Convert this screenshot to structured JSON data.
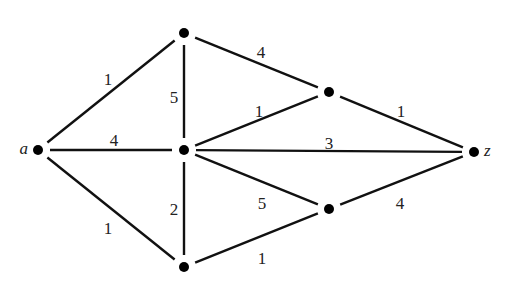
{
  "diagram": {
    "type": "weighted-undirected-graph",
    "nodes": [
      {
        "id": "a",
        "label": "a",
        "x": 38,
        "y": 150
      },
      {
        "id": "t",
        "label": "",
        "x": 184,
        "y": 33
      },
      {
        "id": "c",
        "label": "",
        "x": 184,
        "y": 150
      },
      {
        "id": "b",
        "label": "",
        "x": 184,
        "y": 267
      },
      {
        "id": "u",
        "label": "",
        "x": 329,
        "y": 92
      },
      {
        "id": "l",
        "label": "",
        "x": 329,
        "y": 209
      },
      {
        "id": "z",
        "label": "z",
        "x": 474,
        "y": 152
      }
    ],
    "edges": [
      {
        "from": "a",
        "to": "t",
        "weight": "1",
        "lx": 108,
        "ly": 81
      },
      {
        "from": "a",
        "to": "c",
        "weight": "4",
        "lx": 114,
        "ly": 142
      },
      {
        "from": "a",
        "to": "b",
        "weight": "1",
        "lx": 108,
        "ly": 230
      },
      {
        "from": "t",
        "to": "c",
        "weight": "5",
        "lx": 174,
        "ly": 99
      },
      {
        "from": "t",
        "to": "u",
        "weight": "4",
        "lx": 261,
        "ly": 54
      },
      {
        "from": "c",
        "to": "u",
        "weight": "1",
        "lx": 259,
        "ly": 113
      },
      {
        "from": "c",
        "to": "z",
        "weight": "3",
        "lx": 329,
        "ly": 145
      },
      {
        "from": "c",
        "to": "b",
        "weight": "2",
        "lx": 174,
        "ly": 211
      },
      {
        "from": "c",
        "to": "l",
        "weight": "5",
        "lx": 262,
        "ly": 205
      },
      {
        "from": "u",
        "to": "z",
        "weight": "1",
        "lx": 401,
        "ly": 113
      },
      {
        "from": "l",
        "to": "z",
        "weight": "4",
        "lx": 400,
        "ly": 205
      },
      {
        "from": "b",
        "to": "l",
        "weight": "1",
        "lx": 262,
        "ly": 260
      }
    ]
  }
}
